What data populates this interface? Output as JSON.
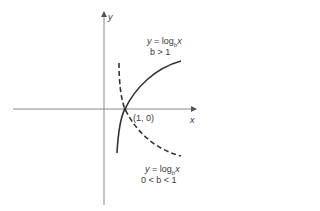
{
  "diagram": {
    "axes": {
      "x_label": "x",
      "y_label": "y"
    },
    "point_label": "(1, 0)",
    "curves": [
      {
        "name": "increasing",
        "style": "solid",
        "eq_y": "y",
        "eq_eq": " = log",
        "eq_sub": "b",
        "eq_x": "x",
        "condition": "b > 1"
      },
      {
        "name": "decreasing",
        "style": "dashed",
        "eq_y": "y",
        "eq_eq": " = log",
        "eq_sub": "b",
        "eq_x": "x",
        "condition": "0 < b < 1"
      }
    ],
    "colors": {
      "axis": "#888888",
      "curve": "#333333",
      "text": "#3a3a3a"
    }
  }
}
